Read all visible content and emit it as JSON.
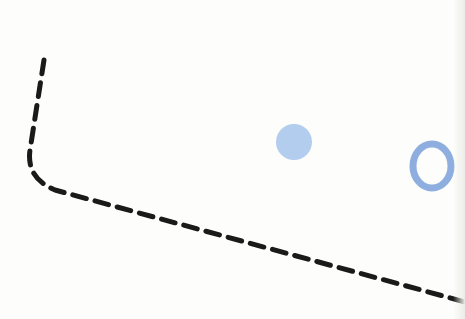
{
  "diagram": {
    "background": "#fdfdfb",
    "dashed_path": {
      "color": "#1a1a1a",
      "stroke_width": 5,
      "dash": "14 9",
      "d": "M 44 60 L 30 150 Q 26 178 55 190 L 465 302"
    },
    "filled_circle": {
      "cx": 294,
      "cy": 142,
      "r": 18,
      "fill": "#b3cdee"
    },
    "ring": {
      "cx": 432,
      "cy": 166,
      "rx": 19,
      "ry": 22,
      "stroke": "#8eaee0",
      "stroke_width": 7
    }
  }
}
